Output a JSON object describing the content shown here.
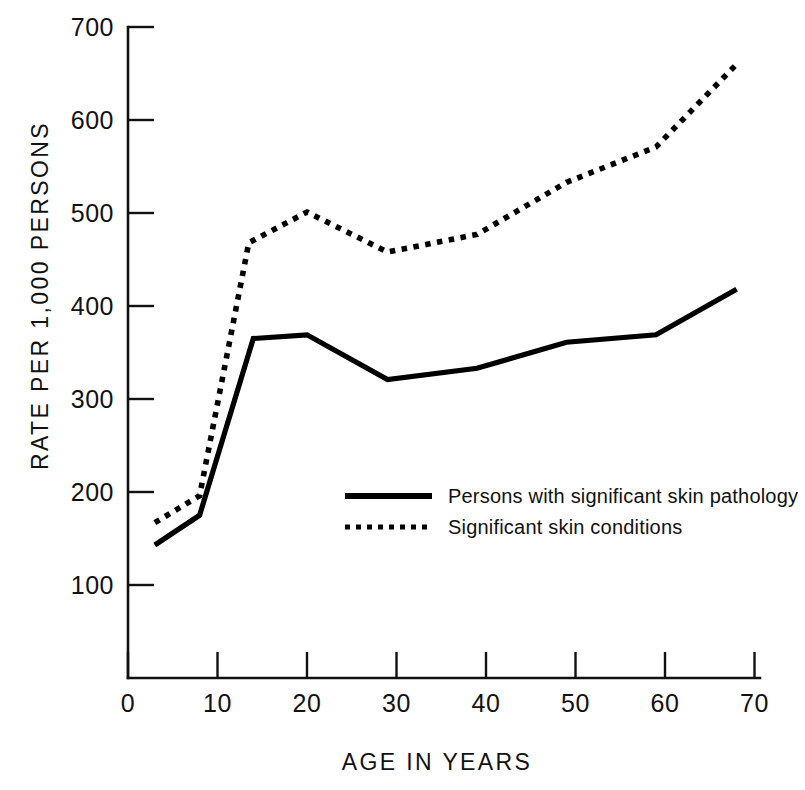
{
  "chart_data": {
    "type": "line",
    "title": "",
    "xlabel": "AGE IN YEARS",
    "ylabel": "RATE PER 1,000 PERSONS",
    "xlim": [
      0,
      70
    ],
    "ylim": [
      0,
      700
    ],
    "xticks": [
      0,
      10,
      20,
      30,
      40,
      50,
      60,
      70
    ],
    "xtick_labels": [
      "0",
      "10",
      "20",
      "30",
      "40",
      "50",
      "60",
      "70"
    ],
    "yticks": [
      100,
      200,
      300,
      400,
      500,
      600,
      700
    ],
    "ytick_labels": [
      "100",
      "200",
      "300",
      "400",
      "500",
      "600",
      "700"
    ],
    "grid": false,
    "legend_position": "center",
    "series": [
      {
        "name": "Persons with significant skin pathology",
        "style": "solid",
        "color": "#000000",
        "x": [
          3,
          8,
          14,
          20,
          29,
          39,
          49,
          59,
          68
        ],
        "values": [
          143,
          175,
          365,
          369,
          321,
          333,
          361,
          369,
          418
        ]
      },
      {
        "name": "Significant skin conditions",
        "style": "dotted",
        "color": "#000000",
        "x": [
          3,
          8,
          13.5,
          20,
          29,
          39,
          49,
          59,
          68
        ],
        "values": [
          167,
          196,
          468,
          501,
          458,
          477,
          533,
          571,
          660
        ]
      }
    ]
  },
  "legend": {
    "items": [
      {
        "label": "Persons with significant skin pathology",
        "style": "solid"
      },
      {
        "label": "Significant skin conditions",
        "style": "dotted"
      }
    ]
  },
  "axes": {
    "y_title": "RATE PER 1,000 PERSONS",
    "x_title": "AGE IN YEARS"
  }
}
